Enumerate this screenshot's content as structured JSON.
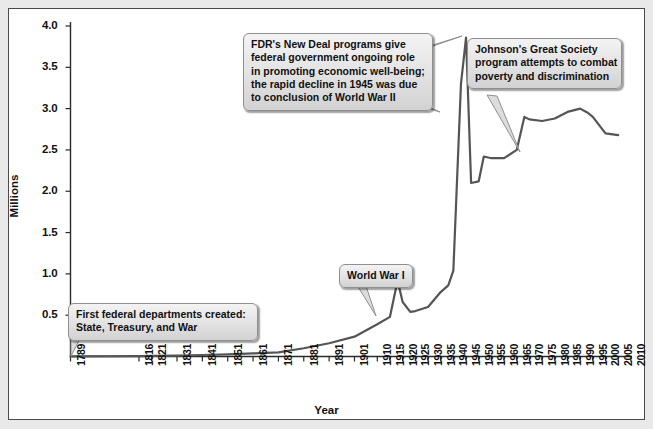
{
  "chart_data": {
    "type": "line",
    "title": "",
    "xlabel": "Year",
    "ylabel": "Millions",
    "ylim": [
      0,
      4.0
    ],
    "xlim": [
      1789,
      2010
    ],
    "grid": false,
    "legend": false,
    "y_ticks": [
      "0.5",
      "1.0",
      "1.5",
      "2.0",
      "2.5",
      "3.0",
      "3.5",
      "4.0"
    ],
    "y_tick_values": [
      0.5,
      1.0,
      1.5,
      2.0,
      2.5,
      3.0,
      3.5,
      4.0
    ],
    "x_ticks": [
      "1789",
      "1816",
      "1821",
      "1831",
      "1841",
      "1851",
      "1861",
      "1871",
      "1881",
      "1891",
      "1901",
      "1910",
      "1915",
      "1920",
      "1925",
      "1930",
      "1935",
      "1940",
      "1945",
      "1950",
      "1955",
      "1960",
      "1965",
      "1970",
      "1975",
      "1980",
      "1985",
      "1990",
      "1995",
      "2000",
      "2005",
      "2010"
    ],
    "series": [
      {
        "name": "Federal civilian employment",
        "x": [
          1789,
          1816,
          1821,
          1831,
          1841,
          1851,
          1861,
          1871,
          1881,
          1891,
          1901,
          1910,
          1915,
          1918,
          1920,
          1923,
          1925,
          1930,
          1935,
          1938,
          1940,
          1943,
          1945,
          1947,
          1950,
          1952,
          1955,
          1960,
          1965,
          1968,
          1970,
          1975,
          1980,
          1985,
          1990,
          1993,
          1995,
          2000,
          2005
        ],
        "y": [
          0.001,
          0.005,
          0.007,
          0.011,
          0.018,
          0.026,
          0.037,
          0.051,
          0.1,
          0.16,
          0.24,
          0.39,
          0.48,
          0.92,
          0.66,
          0.54,
          0.55,
          0.6,
          0.78,
          0.86,
          1.04,
          3.3,
          3.86,
          2.1,
          2.12,
          2.42,
          2.4,
          2.4,
          2.5,
          2.9,
          2.87,
          2.85,
          2.88,
          2.96,
          3.0,
          2.95,
          2.9,
          2.7,
          2.68
        ],
        "color": "#555555"
      }
    ],
    "annotations": [
      {
        "id": "fdr",
        "lines": [
          "FDR's New Deal programs give",
          "federal government ongoing role",
          "in promoting economic well-being;",
          "the rapid decline in 1945 was due",
          "to conclusion of World War II"
        ],
        "points_to_year": 1944
      },
      {
        "id": "johnson",
        "lines": [
          "Johnson's Great Society",
          "program attempts to combat",
          "poverty and discrimination"
        ],
        "points_to_year": 1965
      },
      {
        "id": "wwi",
        "lines": [
          "World War I"
        ],
        "points_to_year": 1918
      },
      {
        "id": "departments",
        "lines": [
          "First federal departments created:",
          "State, Treasury, and War"
        ],
        "points_to_year": 1789
      }
    ]
  },
  "colors": {
    "line": "#555555",
    "axis": "#2b2b2b",
    "callout_bg": "#e2e2e2",
    "callout_border": "#8f8f8f",
    "frame_border": "#4a4a4a",
    "page_bg": "#e9e9e9"
  }
}
